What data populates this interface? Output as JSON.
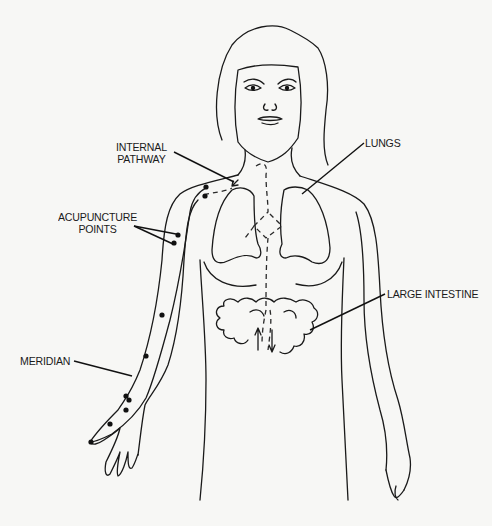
{
  "figure": {
    "ink_color": "#1a1a1a",
    "background": "#f7f7f5"
  },
  "labels": {
    "internal_pathway": {
      "line1": "INTERNAL",
      "line2": "PATHWAY"
    },
    "lungs": "LUNGS",
    "acupuncture_points": {
      "line1": "ACUPUNCTURE",
      "line2": "POINTS"
    },
    "large_intestine": "LARGE INTESTINE",
    "meridian": "MERIDIAN"
  }
}
